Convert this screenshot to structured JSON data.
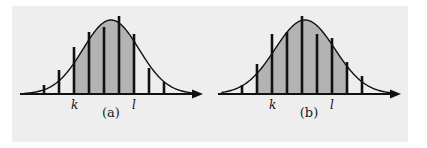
{
  "figure": {
    "background_color": "#ffffff",
    "plate_color": "#eeeeee",
    "curve_color": "#111111",
    "bar_color": "#111111",
    "shade_color": "#b3b3b3",
    "axis_color": "#111111"
  },
  "panels": [
    {
      "id": "a",
      "caption": "(a)",
      "axis_labels": {
        "k": "k",
        "l": "l"
      },
      "k_label_x": 62,
      "l_label_x": 122,
      "shade_from": 62,
      "shade_to": 122,
      "bars": [
        {
          "x": 32,
          "height": 9
        },
        {
          "x": 47,
          "height": 24
        },
        {
          "x": 62,
          "height": 47
        },
        {
          "x": 77,
          "height": 62
        },
        {
          "x": 92,
          "height": 67
        },
        {
          "x": 107,
          "height": 78
        },
        {
          "x": 122,
          "height": 60
        },
        {
          "x": 137,
          "height": 26
        },
        {
          "x": 152,
          "height": 12
        }
      ]
    },
    {
      "id": "b",
      "caption": "(b)",
      "axis_labels": {
        "k": "k",
        "l": "l"
      },
      "k_label_x": 62,
      "l_label_x": 122,
      "shade_from": 47,
      "shade_to": 137,
      "bars": [
        {
          "x": 32,
          "height": 9
        },
        {
          "x": 47,
          "height": 30
        },
        {
          "x": 62,
          "height": 60
        },
        {
          "x": 77,
          "height": 62
        },
        {
          "x": 92,
          "height": 78
        },
        {
          "x": 107,
          "height": 60
        },
        {
          "x": 122,
          "height": 56
        },
        {
          "x": 137,
          "height": 32
        },
        {
          "x": 152,
          "height": 18
        }
      ]
    }
  ],
  "chart_data": {
    "type": "bar",
    "title": "",
    "subtitle": "",
    "xlabel": "",
    "ylabel": "",
    "grid": false,
    "legend": "none",
    "annotations": [
      "k",
      "l",
      "(a)",
      "(b)"
    ],
    "panels": [
      {
        "id": "a",
        "caption": "(a)",
        "curve": "normal",
        "mean_x": 99,
        "sigma_px": 28,
        "categories": [
          "x1",
          "x2",
          "k",
          "x4",
          "x5",
          "x6",
          "l",
          "x8",
          "x9"
        ],
        "values": [
          9,
          24,
          47,
          62,
          67,
          78,
          60,
          26,
          12
        ],
        "shaded_categories": [
          "k",
          "x4",
          "x5",
          "x6",
          "l"
        ],
        "marked_points": {
          "k": "k",
          "l": "l"
        }
      },
      {
        "id": "b",
        "caption": "(b)",
        "curve": "normal",
        "mean_x": 95,
        "sigma_px": 30,
        "categories": [
          "x1",
          "x2",
          "k",
          "x4",
          "x5",
          "x6",
          "l",
          "x8",
          "x9"
        ],
        "values": [
          9,
          30,
          60,
          62,
          78,
          60,
          56,
          32,
          18
        ],
        "shaded_categories": [
          "x2",
          "k",
          "x4",
          "x5",
          "x6",
          "l",
          "x8"
        ],
        "marked_points": {
          "k": "k",
          "l": "l"
        }
      }
    ]
  }
}
